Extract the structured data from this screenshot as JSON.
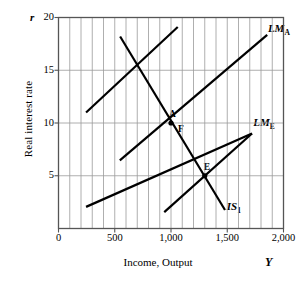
{
  "chart_data": {
    "type": "line",
    "title": "",
    "xlabel": "Income, Output",
    "ylabel": "Real interest rate",
    "x_axis_symbol": "Y",
    "y_axis_symbol": "r",
    "xlim": [
      0,
      2000
    ],
    "ylim": [
      0,
      20
    ],
    "xticks": [
      0,
      500,
      1000,
      1500,
      2000
    ],
    "xtick_labels": [
      "0",
      "500",
      "1,000",
      "1,500",
      "2,000"
    ],
    "yticks": [
      5,
      10,
      15,
      20
    ],
    "ytick_labels": [
      "5",
      "10",
      "15",
      "20"
    ],
    "grid": {
      "vertical_step": 100,
      "horizontal_at": [
        5,
        10,
        15
      ],
      "color": "#9b9b9b"
    },
    "series": [
      {
        "name": "LM_A",
        "label": "LM",
        "label_sub": "A",
        "type": "line",
        "points": [
          [
            545,
            6.45
          ],
          [
            1855,
            18.35
          ]
        ],
        "label_pos": [
          1870,
          19.0
        ]
      },
      {
        "name": "LM_E",
        "label": "LM",
        "label_sub": "E",
        "type": "line",
        "points": [
          [
            245,
            2.05
          ],
          [
            1720,
            9.0
          ]
        ],
        "label_pos": [
          1740,
          10.1
        ]
      },
      {
        "name": "IS_1",
        "label": "IS",
        "label_sub": "1",
        "type": "line",
        "points": [
          [
            548,
            18.2
          ],
          [
            1480,
            1.75
          ]
        ],
        "label_pos": [
          1505,
          2.1
        ]
      },
      {
        "name": "LM_A_upper_segment",
        "label": "",
        "label_sub": "",
        "type": "line",
        "points": [
          [
            245,
            11.0
          ],
          [
            1060,
            19.1
          ]
        ],
        "label_pos": null
      },
      {
        "name": "IS_lower_segment",
        "label": "",
        "label_sub": "",
        "type": "line",
        "points": [
          [
            940,
            1.55
          ],
          [
            1720,
            9.0
          ]
        ],
        "label_pos": null
      }
    ],
    "points": [
      {
        "name": "A",
        "label": "A",
        "x": 1000,
        "y": 10,
        "label_dx": -2,
        "label_dy": -9,
        "marker": true
      },
      {
        "name": "F",
        "label": "F",
        "x": 1000,
        "y": 10,
        "label_dx": 7,
        "label_dy": 6,
        "marker": false
      },
      {
        "name": "E",
        "label": "E",
        "x": 1300,
        "y": 5,
        "label_dx": -1,
        "label_dy": -9,
        "marker": true
      }
    ],
    "annotations": []
  },
  "colors": {
    "curve": "#000000",
    "grid": "#9b9b9b",
    "axis": "#555555",
    "text": "#000000",
    "background": "#ffffff"
  }
}
